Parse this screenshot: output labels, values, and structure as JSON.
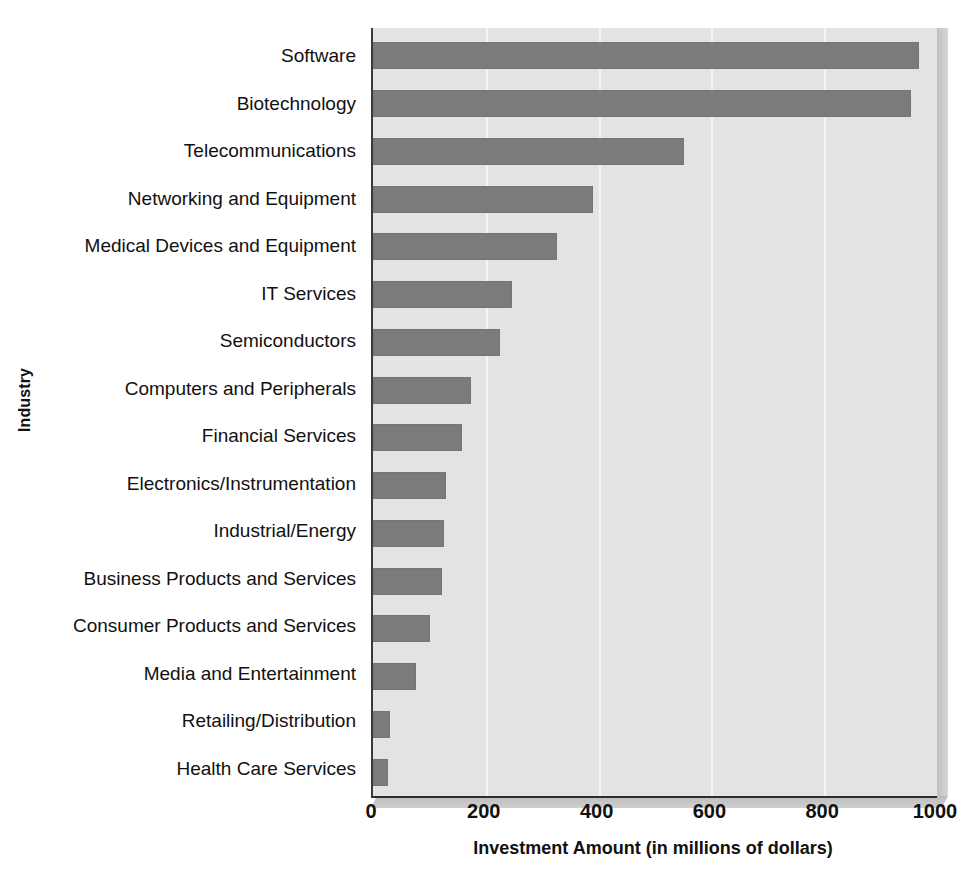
{
  "chart_data": {
    "type": "bar",
    "orientation": "horizontal",
    "title": "",
    "xlabel": "Investment Amount (in millions of dollars)",
    "ylabel": "Industry",
    "xlim": [
      0,
      1000
    ],
    "xticks": [
      0,
      200,
      400,
      600,
      800,
      1000
    ],
    "xtick_labels": [
      "0",
      "200",
      "400",
      "600",
      "800",
      "1000"
    ],
    "grid": "vertical",
    "legend": "none",
    "bar_color": "#7b7b7b",
    "plot_background": "#e3e3e3",
    "categories": [
      "Software",
      "Biotechnology",
      "Telecommunications",
      "Networking and Equipment",
      "Medical Devices and Equipment",
      "IT Services",
      "Semiconductors",
      "Computers and Peripherals",
      "Financial Services",
      "Electronics/Instrumentation",
      "Industrial/Energy",
      "Business Products and Services",
      "Consumer Products and Services",
      "Media and Entertainment",
      "Retailing/Distribution",
      "Health Care Services"
    ],
    "values": [
      968,
      954,
      551,
      390,
      327,
      247,
      226,
      174,
      158,
      130,
      126,
      123,
      101,
      77,
      30,
      27
    ]
  }
}
